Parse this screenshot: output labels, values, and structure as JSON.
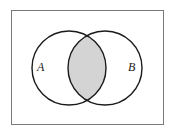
{
  "diagram": {
    "type": "venn",
    "universe": {
      "label": ""
    },
    "sets": [
      {
        "label": "A"
      },
      {
        "label": "B"
      }
    ],
    "shaded_region": "A ∩ B",
    "colors": {
      "background": "#ffffff",
      "frame": "#7a7a7a",
      "circle_stroke": "#1a1a1a",
      "shade": "#d4d4d4"
    }
  }
}
